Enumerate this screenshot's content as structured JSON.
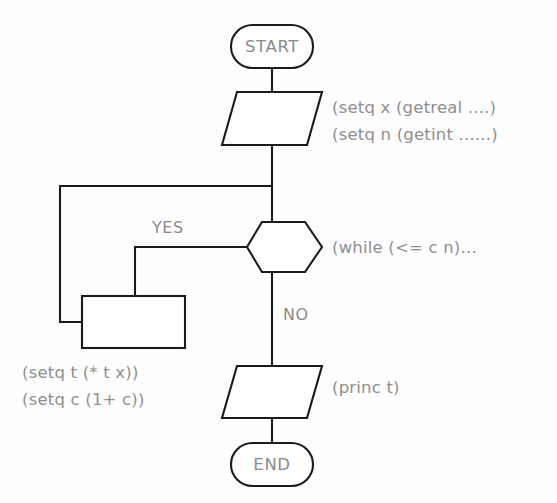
{
  "diagram": {
    "background_color": "#fefefe",
    "line_color": "#1a1a1a",
    "text_color": "#8a8a8a"
  },
  "nodes": {
    "start": {
      "label": "START",
      "shape": "terminator"
    },
    "input": {
      "shape": "parallelogram"
    },
    "decision": {
      "shape": "hexagon"
    },
    "process": {
      "shape": "rectangle"
    },
    "output": {
      "shape": "parallelogram"
    },
    "end": {
      "label": "END",
      "shape": "terminator"
    }
  },
  "branches": {
    "yes": "YES",
    "no": "NO"
  },
  "annotations": {
    "input_line1": "(setq x (getreal ....)",
    "input_line2": "(setq n (getint ......)",
    "decision": "(while (<= c n)...",
    "process_line1": "(setq t (* t x))",
    "process_line2": "(setq c (1+ c))",
    "output": "(princ t)"
  }
}
